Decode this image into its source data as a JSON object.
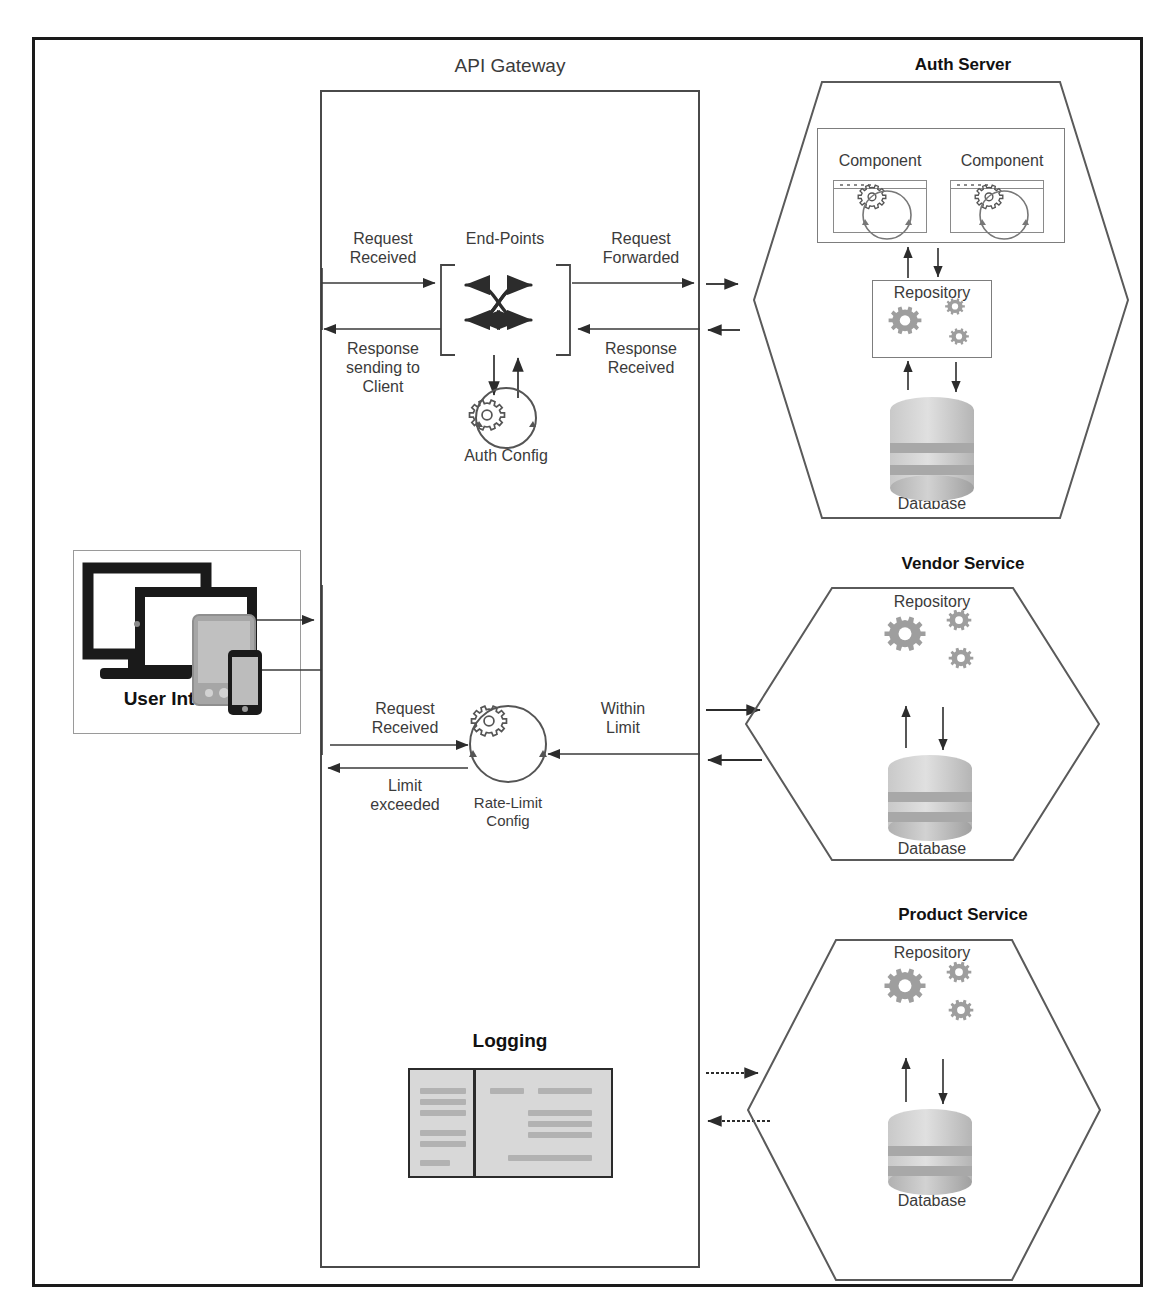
{
  "diagram": {
    "colors": {
      "frame_border": "#1a1a1a",
      "box_border": "#4a4a4a",
      "hex_border": "#5a5a5a",
      "text": "#3b3b3b",
      "gear_gray": "#9e9e9e",
      "db_gray": "#bdbdbd",
      "log_fill": "#d8d8d8"
    }
  },
  "gateway": {
    "title": "API Gateway",
    "endpoints_label": "End-Points",
    "auth_config_label": "Auth Config",
    "rate_limit_label": "Rate-Limit\nConfig",
    "logging_label": "Logging",
    "flows": {
      "request_received_top": "Request\nReceived",
      "response_sending_to_client": "Response\nsending to\nClient",
      "request_forwarded": "Request\nForwarded",
      "response_received": "Response\nReceived",
      "request_received_rate": "Request\nReceived",
      "limit_exceeded": "Limit\nexceeded",
      "within_limit": "Within\nLimit"
    }
  },
  "user_interface": {
    "label": "User Interface",
    "icons": [
      "monitor-icon",
      "laptop-icon",
      "tablet-icon",
      "phone-icon"
    ]
  },
  "services": [
    {
      "id": "auth-server",
      "title": "Auth Server",
      "components": [
        {
          "line1": "Component",
          "line2": "(Auth)"
        },
        {
          "line1": "Component",
          "line2": "(user)"
        }
      ],
      "repository_label": "Repository",
      "database_label": "Database"
    },
    {
      "id": "vendor-service",
      "title": "Vendor Service",
      "components": [],
      "repository_label": "Repository",
      "database_label": "Database"
    },
    {
      "id": "product-service",
      "title": "Product Service",
      "components": [],
      "repository_label": "Repository",
      "database_label": "Database"
    }
  ]
}
